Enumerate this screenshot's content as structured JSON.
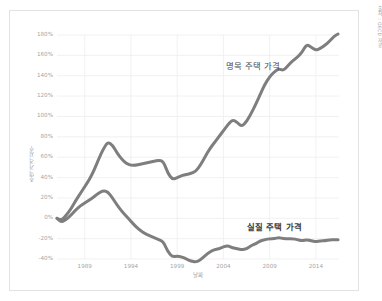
{
  "source_credit": "출처 : OECD 자료",
  "chart_data": {
    "type": "line",
    "title": "",
    "xlabel": "날짜",
    "ylabel": "주택 가격 지수",
    "xlim": [
      1986,
      2016.5
    ],
    "ylim": [
      -40,
      180
    ],
    "grid": true,
    "legend_position": "inline-annotation",
    "y_ticks": [
      "180%",
      "160%",
      "140%",
      "120%",
      "100%",
      "80%",
      "60%",
      "40%",
      "20%",
      "0%",
      "-20%",
      "-40%"
    ],
    "y_tick_values": [
      180,
      160,
      140,
      120,
      100,
      80,
      60,
      40,
      20,
      0,
      -20,
      -40
    ],
    "x_ticks": [
      "1989",
      "1994",
      "1999",
      "2004",
      "2009",
      "2014"
    ],
    "x_tick_values": [
      1989,
      1994,
      1999,
      2004,
      2009,
      2014
    ],
    "line_color": "#7e7e7e",
    "grid_color": "#ededed",
    "series": [
      {
        "name": "명목 주택 가격",
        "label_x": 2007.2,
        "label_y": 150,
        "bold": false,
        "x": [
          1986.0,
          1986.5,
          1987.0,
          1987.5,
          1988.0,
          1988.5,
          1989.0,
          1989.5,
          1990.0,
          1990.5,
          1991.0,
          1991.5,
          1992.0,
          1992.5,
          1993.0,
          1993.5,
          1994.0,
          1994.5,
          1995.0,
          1995.5,
          1996.0,
          1996.5,
          1997.0,
          1997.5,
          1998.0,
          1998.5,
          1999.0,
          1999.5,
          2000.0,
          2000.5,
          2001.0,
          2001.5,
          2002.0,
          2002.5,
          2003.0,
          2003.5,
          2004.0,
          2004.5,
          2005.0,
          2005.5,
          2006.0,
          2006.5,
          2007.0,
          2007.5,
          2008.0,
          2008.5,
          2009.0,
          2009.5,
          2010.0,
          2010.5,
          2011.0,
          2011.5,
          2012.0,
          2012.5,
          2013.0,
          2013.5,
          2014.0,
          2014.5,
          2015.0,
          2015.5,
          2016.0,
          2016.4
        ],
        "values": [
          0,
          -2,
          3,
          9,
          17,
          24,
          31,
          38,
          47,
          58,
          68,
          75,
          72,
          64,
          58,
          54,
          52,
          52,
          53,
          54,
          55,
          56,
          57,
          56,
          44,
          38,
          40,
          42,
          43,
          44,
          46,
          52,
          60,
          68,
          74,
          80,
          86,
          92,
          97,
          94,
          90,
          95,
          103,
          112,
          122,
          132,
          139,
          144,
          147,
          145,
          150,
          155,
          158,
          163,
          171,
          168,
          165,
          167,
          170,
          174,
          179,
          181
        ]
      },
      {
        "name": "실질 주택 가격",
        "label_x": 2009.5,
        "label_y": -9,
        "bold": true,
        "x": [
          1986.0,
          1986.5,
          1987.0,
          1987.5,
          1988.0,
          1988.5,
          1989.0,
          1989.5,
          1990.0,
          1990.5,
          1991.0,
          1991.5,
          1992.0,
          1992.5,
          1993.0,
          1993.5,
          1994.0,
          1994.5,
          1995.0,
          1995.5,
          1996.0,
          1996.5,
          1997.0,
          1997.5,
          1998.0,
          1998.5,
          1999.0,
          1999.5,
          2000.0,
          2000.5,
          2001.0,
          2001.5,
          2002.0,
          2002.5,
          2003.0,
          2003.5,
          2004.0,
          2004.5,
          2005.0,
          2005.5,
          2006.0,
          2006.5,
          2007.0,
          2007.5,
          2008.0,
          2008.5,
          2009.0,
          2009.5,
          2010.0,
          2010.5,
          2011.0,
          2011.5,
          2012.0,
          2012.5,
          2013.0,
          2013.5,
          2014.0,
          2014.5,
          2015.0,
          2015.5,
          2016.0,
          2016.4
        ],
        "values": [
          0,
          -4,
          -1,
          3,
          8,
          12,
          15,
          18,
          21,
          25,
          27,
          26,
          20,
          13,
          7,
          2,
          -3,
          -8,
          -12,
          -15,
          -17,
          -19,
          -21,
          -23,
          -33,
          -38,
          -37,
          -38,
          -40,
          -42,
          -43,
          -41,
          -37,
          -33,
          -31,
          -30,
          -28,
          -27,
          -29,
          -30,
          -31,
          -30,
          -27,
          -25,
          -22,
          -21,
          -20,
          -20,
          -19,
          -20,
          -20,
          -20,
          -21,
          -22,
          -21,
          -22,
          -23,
          -22,
          -22,
          -21,
          -21,
          -21
        ]
      }
    ]
  }
}
